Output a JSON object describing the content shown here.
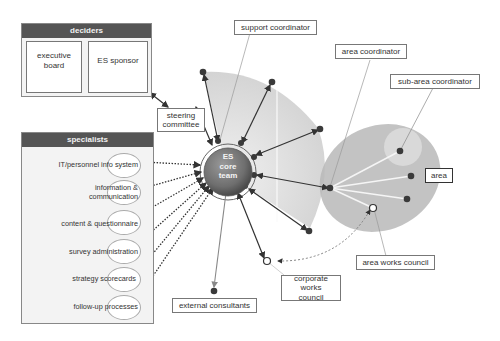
{
  "deciders": {
    "title": "deciders",
    "items": [
      {
        "label": "executive board"
      },
      {
        "label": "ES sponsor"
      }
    ]
  },
  "specialists": {
    "title": "specialists",
    "items": [
      {
        "label": "IT/personnel info system"
      },
      {
        "label": "information & communication"
      },
      {
        "label": "content & questionnaire"
      },
      {
        "label": "survey administration"
      },
      {
        "label": "strategy scorecards"
      },
      {
        "label": "follow-up processes"
      }
    ]
  },
  "core": {
    "label_line1": "ES",
    "label_line2": "core",
    "label_line3": "team"
  },
  "labels": {
    "steering_committee": "steering committee",
    "support_coordinator": "support coordinator",
    "area_coordinator": "area coordinator",
    "sub_area_coordinator": "sub-area coordinator",
    "area": "area",
    "area_works_council": "area works council",
    "corporate_works_council": "corporate works council",
    "external_consultants": "external consultants"
  },
  "colors": {
    "panel_header": "#555555",
    "core_fill": "#7a7a7a",
    "fan_shade": "#d6d6d6",
    "area_shade": "#b5b5b5",
    "sub_area_shade": "#d8d8d8",
    "node": "#3a3a3a"
  }
}
